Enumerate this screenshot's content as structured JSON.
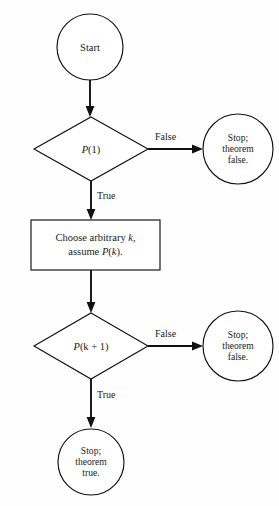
{
  "figure": {
    "type": "flowchart",
    "colors": {
      "background": "#fefefe",
      "stroke": "#111111",
      "text": "#1a1a1a",
      "shape_fill": "#ffffff"
    }
  },
  "nodes": {
    "start": {
      "shape": "circle",
      "label": "Start"
    },
    "decision_base": {
      "shape": "diamond",
      "label_prefix": "P",
      "label_arg": "(1)"
    },
    "stop_false_1": {
      "shape": "circle",
      "line1": "Stop;",
      "line2": "theorem",
      "line3": "false."
    },
    "process": {
      "shape": "rectangle",
      "line1_plain": "Choose arbitrary ",
      "line1_math": "k",
      "line1_tail": ",",
      "line2_plain": "assume ",
      "line2_math": "P",
      "line2_arg": "(",
      "line2_math2": "k",
      "line2_tail": ")."
    },
    "decision_step": {
      "shape": "diamond",
      "label_prefix": "P",
      "label_arg": "(k + 1)"
    },
    "stop_false_2": {
      "shape": "circle",
      "line1": "Stop;",
      "line2": "theorem",
      "line3": "false."
    },
    "stop_true": {
      "shape": "circle",
      "line1": "Stop;",
      "line2": "theorem",
      "line3": "true."
    }
  },
  "edges": {
    "start_to_base": {
      "label": ""
    },
    "base_false": {
      "label": "False"
    },
    "base_true": {
      "label": "True"
    },
    "process_to_step": {
      "label": ""
    },
    "step_false": {
      "label": "False"
    },
    "step_true": {
      "label": "True"
    }
  }
}
